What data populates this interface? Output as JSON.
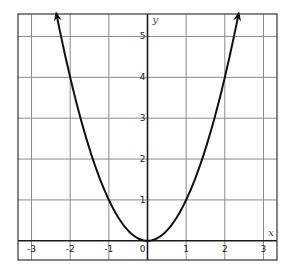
{
  "chart_data": {
    "type": "line",
    "title": "",
    "function": "y = x^2",
    "xlabel": "x",
    "ylabel": "y",
    "xlim": [
      -3.35,
      3.35
    ],
    "ylim": [
      -0.47,
      5.55
    ],
    "grid": true,
    "x_ticks": [
      -3,
      -2,
      -1,
      0,
      1,
      2,
      3
    ],
    "x_tick_labels": [
      "-3",
      "-2",
      "-1",
      "0",
      "1",
      "2",
      "3"
    ],
    "y_ticks": [
      1,
      2,
      3,
      4,
      5
    ],
    "y_tick_labels": [
      "1",
      "2",
      "3",
      "4",
      "5"
    ],
    "series": [
      {
        "name": "y = x^2",
        "x": [
          -2.36,
          -2,
          -1.5,
          -1,
          -0.5,
          0,
          0.5,
          1,
          1.5,
          2,
          2.36
        ],
        "y": [
          5.57,
          4,
          2.25,
          1,
          0.25,
          0,
          0.25,
          1,
          2.25,
          4,
          5.57
        ],
        "arrows_at_ends": true
      }
    ],
    "colors": {
      "curve": "#111111",
      "grid": "#8a8a8a",
      "axis": "#1a1a1a"
    }
  }
}
